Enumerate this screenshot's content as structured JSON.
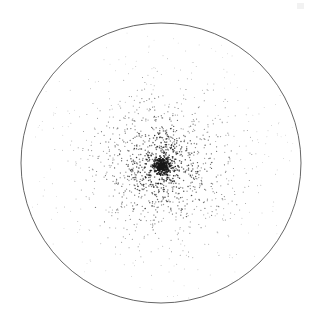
{
  "figure": {
    "width": 314,
    "height": 327,
    "background_color": "#ffffff",
    "title": "",
    "caption": ""
  },
  "boundary_circle": {
    "name": "tidal-radius-circle",
    "center_x": 161,
    "center_y": 163,
    "radius": 140,
    "stroke_color": "#555555",
    "stroke_width": 0.9,
    "fill": "none"
  },
  "artifact": {
    "visible": true,
    "x": 297,
    "y": 3,
    "width": 7,
    "height": 6,
    "color": "#f2f2f2"
  },
  "chart_data": {
    "type": "scatter",
    "title": "",
    "subtitle": "",
    "xlabel": "",
    "ylabel": "",
    "xlim": [
      -140,
      140
    ],
    "ylim": [
      -140,
      140
    ],
    "grid": false,
    "axes_visible": false,
    "tick_labels_x": [],
    "tick_labels_y": [],
    "legend": [],
    "annotations": [],
    "marker": {
      "shape": "dot",
      "color": "#1a1a1a",
      "min_size_px": 0.8,
      "max_size_px": 1.9,
      "min_opacity": 0.28,
      "max_opacity": 1.0
    },
    "point_count": 1560,
    "distribution": {
      "model": "king_profile",
      "description": "Radially symmetric star-cluster surface density: dense dark core fading to sparse faint points at the tidal boundary",
      "center_x": 162,
      "center_y": 166,
      "core_radius": 9,
      "tidal_radius": 138,
      "random_seed": 20240517
    },
    "radial_density_profile": {
      "radius_bins": [
        0,
        10,
        20,
        30,
        40,
        50,
        60,
        70,
        80,
        90,
        100,
        110,
        120,
        130,
        140
      ],
      "counts": [
        168,
        196,
        182,
        164,
        146,
        124,
        106,
        90,
        74,
        62,
        50,
        40,
        30,
        22
      ]
    }
  }
}
